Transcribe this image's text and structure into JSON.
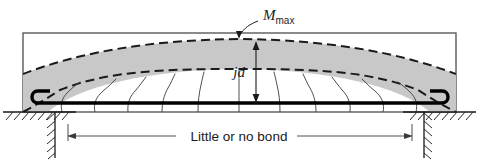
{
  "figure": {
    "labels": {
      "moment": "M",
      "moment_subscript": "max",
      "lever_arm": "jd",
      "span_note": "Little or no bond"
    },
    "colors": {
      "shaded_arch": "#c8c8c8",
      "line": "#1a1a1a",
      "rebar": "#000000",
      "beam_outline": "#555555",
      "crack": "#3a3a3a",
      "hatch": "#2b2b2b",
      "background": "#ffffff"
    },
    "geometry": {
      "beam_left": 23,
      "beam_right": 456,
      "beam_top": 33,
      "beam_bottom": 112,
      "rebar_y": 103,
      "ground_y": 112,
      "dimension_y": 136,
      "dimension_left": 68,
      "dimension_right": 412
    },
    "elements": {
      "beam_outline": "beam-rectangle",
      "compression_arch": "shaded-arch-band",
      "upper_arch_curve": "dashed-curve-upper",
      "lower_arch_curve": "dashed-curve-lower",
      "reinforcement": "rebar-with-hooks",
      "left_hook": "rebar-hook-left",
      "right_hook": "rebar-hook-right",
      "cracks": "flexural-crack-lines",
      "left_support": "hatched-support-left",
      "right_support": "hatched-support-right",
      "moment_leader": "moment-leader-line",
      "lever_arm_dimension": "jd-dimension-arrow",
      "span_dimension": "little-or-no-bond-dimension"
    }
  }
}
